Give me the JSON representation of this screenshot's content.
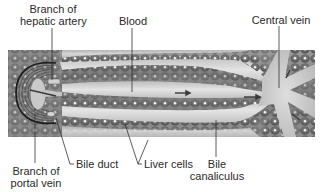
{
  "figure": {
    "colors": {
      "background": "#ffffff",
      "tissue_base": "#8a8a8a",
      "cell_fill": "#6e6e6e",
      "nucleus": "#f2f2f2",
      "sinusoid": "#cfcfcf",
      "vessel_light": "#d8d8d8",
      "leader_line": "#333333",
      "text": "#2a2a2a"
    }
  },
  "labels": {
    "hepatic_artery": {
      "line1": "Branch of",
      "line2": "hepatic artery"
    },
    "blood": {
      "text": "Blood"
    },
    "central_vein": {
      "text": "Central vein"
    },
    "portal_vein": {
      "line1": "Branch of",
      "line2": "portal vein"
    },
    "bile_duct": {
      "text": "Bile duct"
    },
    "liver_cells": {
      "text": "Liver cells"
    },
    "bile_canaliculus": {
      "line1": "Bile",
      "line2": "canaliculus"
    }
  }
}
